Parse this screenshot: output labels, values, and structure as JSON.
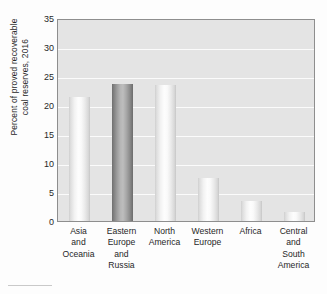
{
  "chart_data": {
    "type": "bar",
    "title": "",
    "xlabel": "",
    "ylabel": "Percent of proved recoverable\ncoal reserves, 2016",
    "ylim": [
      0,
      35
    ],
    "ytick_step": 5,
    "yticks": [
      35,
      30,
      25,
      20,
      15,
      10,
      5,
      0
    ],
    "ytick_labels": [
      "35",
      "30",
      "25",
      "20",
      "15",
      "10",
      "5",
      "0"
    ],
    "grid": true,
    "grid_axis": "y",
    "grid_color": "#fbfbfb",
    "legend": "none",
    "plot_background": "#e4e4e4",
    "categories": [
      "Asia\nand\nOceania",
      "Eastern\nEurope\nand\nRussia",
      "North\nAmerica",
      "Western\nEurope",
      "Africa",
      "Central\nand\nSouth\nAmerica"
    ],
    "values": [
      21.3,
      23.7,
      23.5,
      7.4,
      3.5,
      1.5
    ],
    "bar_styles": [
      "light",
      "dark",
      "light",
      "light",
      "light",
      "light"
    ],
    "colors": {
      "bar_light": "#f2f2f2",
      "bar_dark": "#8f8f8f",
      "axis": "#8e8e8e",
      "text": "#272727",
      "plot_bg": "#e4e4e4",
      "gridline": "#fbfbfb",
      "page_bg": "#fdfdfd"
    }
  }
}
